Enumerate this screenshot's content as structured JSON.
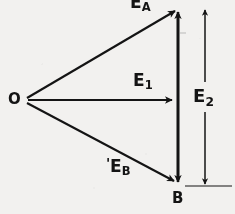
{
  "figure": {
    "type": "vector-diagram",
    "background_color": "#f2f1ef",
    "ink_color": "#141414",
    "points": {
      "O": {
        "label": "O",
        "x": 22,
        "y": 100
      },
      "A": {
        "label": "E",
        "sub": "A",
        "x": 178,
        "y": 8
      },
      "B": {
        "label": "B",
        "x": 178,
        "y": 186
      }
    },
    "labels": {
      "origin": "O",
      "vector_a_base": "E",
      "vector_a_sub": "A",
      "vector_1_base": "E",
      "vector_1_sub": "1",
      "vector_b_base": "E",
      "vector_b_sub": "B",
      "vector_2_base": "E",
      "vector_2_sub": "2",
      "point_b": "B",
      "eb_prefix_tick": "'"
    },
    "vectors": [
      {
        "name": "E_A",
        "from": "O",
        "to": "A",
        "arrow": "single",
        "direction": "up-right"
      },
      {
        "name": "E_1",
        "from": "O",
        "to": "midpoint",
        "arrow": "single",
        "direction": "right"
      },
      {
        "name": "E_B",
        "from": "O",
        "to": "B",
        "arrow": "single",
        "direction": "down-right"
      },
      {
        "name": "E_2_stem",
        "from": "B",
        "to": "A",
        "arrow": "double",
        "direction": "vertical"
      }
    ],
    "dimension": {
      "name": "E_2",
      "label": "E2",
      "arrow": "double",
      "orientation": "vertical",
      "x": 205,
      "top_y": 8,
      "bottom_y": 186
    }
  }
}
